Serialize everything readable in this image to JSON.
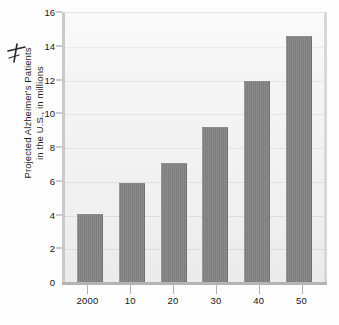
{
  "chart_data": {
    "type": "bar",
    "title": "",
    "subtitle": "",
    "xlabel": "",
    "ylabel": "Projected Alzheimer's Patients in the U.S., in millions",
    "ylabel_lines": [
      "Projected Alzheimer's Patients",
      "in the U.S., in millions"
    ],
    "categories": [
      "2000",
      "10",
      "20",
      "30",
      "40",
      "50"
    ],
    "values": [
      4.0,
      5.8,
      7.0,
      9.1,
      11.85,
      14.5
    ],
    "series": [
      {
        "name": "Projected Alzheimer's Patients",
        "values": [
          4.0,
          5.8,
          7.0,
          9.1,
          11.85,
          14.5
        ]
      }
    ],
    "ylim": [
      0,
      16
    ],
    "xlim_categories": 6,
    "y_ticks": [
      0,
      2,
      4,
      6,
      8,
      10,
      12,
      14,
      16
    ],
    "y_tick_labels": [
      "0",
      "2",
      "4",
      "6",
      "8",
      "10",
      "12",
      "14",
      "16"
    ],
    "x_tick_labels": [
      "2000",
      "10",
      "20",
      "30",
      "40",
      "50"
    ],
    "grid": true,
    "grid_axis": "y",
    "legend": false,
    "legend_position": "none",
    "annotations": [],
    "colors": {
      "bar": "#828282",
      "plot_background": "#f4f4f4",
      "gridline": "#e2e2e2",
      "axis": "#b4b4b4",
      "text": "#161616",
      "page_background": "#ffffff"
    }
  },
  "marks": {
    "pen_mark": "stray-pen-mark"
  }
}
